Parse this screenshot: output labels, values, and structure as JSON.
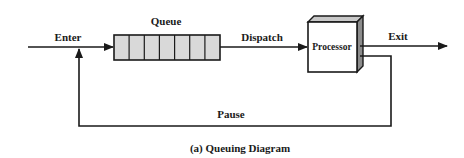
{
  "diagram": {
    "caption": "(a) Queuing Diagram",
    "labels": {
      "enter": "Enter",
      "queue": "Queue",
      "dispatch": "Dispatch",
      "processor": "Processor",
      "exit": "Exit",
      "pause": "Pause"
    },
    "queue": {
      "cells": 7
    },
    "colors": {
      "line": "#1a1a1a",
      "queue_fill": "#d9d9d9",
      "processor_front": "#ffffff",
      "processor_top": "#c8c8c8",
      "processor_side": "#8c8c8c"
    }
  }
}
